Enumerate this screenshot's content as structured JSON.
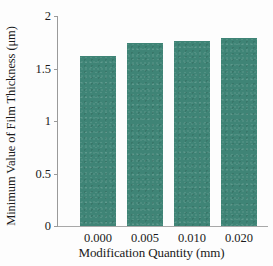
{
  "chart_data": {
    "type": "bar",
    "title": "",
    "xlabel": "Modification Quantity (mm)",
    "ylabel": "Minimum Value of Film Thickness (μm)",
    "categories": [
      "0.000",
      "0.005",
      "0.010",
      "0.020"
    ],
    "values": [
      1.62,
      1.74,
      1.76,
      1.79
    ],
    "series": [
      {
        "name": "Minimum Value of Film Thickness",
        "values": [
          1.62,
          1.74,
          1.76,
          1.79
        ]
      }
    ],
    "ylim": [
      0,
      2
    ],
    "xlim": [
      0,
      4
    ],
    "y_ticks": [
      0,
      0.5,
      1,
      1.5,
      2
    ],
    "y_tick_labels": [
      "0",
      "0.5",
      "1",
      "1.5",
      "2"
    ],
    "x_tick_labels": [
      "0.000",
      "0.005",
      "0.010",
      "0.020"
    ],
    "grid": false,
    "legend": false,
    "legend_position": "none",
    "bar_color": "#3f8476",
    "axis_color": "#9a9a9a",
    "background_color": "#fdfdfd"
  }
}
